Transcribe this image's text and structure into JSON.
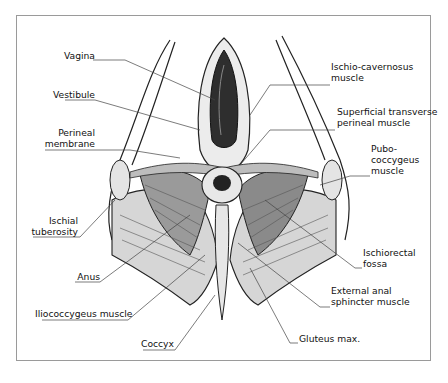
{
  "figure": {
    "frame": {
      "x": 16,
      "y": 15,
      "width": 414,
      "height": 345,
      "border_color": "#9a9a9a"
    },
    "colors": {
      "line": "#222222",
      "muscle_fill": "#d4d4d4",
      "dark_fill": "#3a3a3a",
      "leader": "#444444"
    },
    "labels": [
      {
        "id": "vagina",
        "lines": [
          "Vagina"
        ],
        "align": "right",
        "x": 92,
        "y": 45
      },
      {
        "id": "vestibule",
        "lines": [
          "Vestibule"
        ],
        "align": "right",
        "x": 92,
        "y": 86
      },
      {
        "id": "perineal-membrane",
        "lines": [
          "Perineal",
          "membrane"
        ],
        "align": "right",
        "x": 92,
        "y": 127
      },
      {
        "id": "ischial-tuberosity",
        "lines": [
          "Ischial",
          "tuberosity"
        ],
        "align": "right",
        "x": 76,
        "y": 215
      },
      {
        "id": "anus",
        "lines": [
          "Anus"
        ],
        "align": "right",
        "x": 99,
        "y": 270
      },
      {
        "id": "iliococcygeus-muscle",
        "lines": [
          "Iliococcygeus muscle"
        ],
        "align": "right",
        "x": 127,
        "y": 305
      },
      {
        "id": "coccyx",
        "lines": [
          "Coccyx"
        ],
        "align": "right",
        "x": 173,
        "y": 337
      },
      {
        "id": "ischio-cavernosus-muscle",
        "lines": [
          "Ischio-cavernosus",
          "muscle"
        ],
        "align": "left",
        "x": 331,
        "y": 60
      },
      {
        "id": "superficial-transverse-perineal-muscle",
        "lines": [
          "Superficial transverse",
          "perineal muscle"
        ],
        "align": "left",
        "x": 337,
        "y": 104
      },
      {
        "id": "pubo-coccygeus-muscle",
        "lines": [
          "Pubo-",
          "coccygeus",
          "muscle"
        ],
        "align": "left",
        "x": 371,
        "y": 142
      },
      {
        "id": "ischiorectal-fossa",
        "lines": [
          "Ischiorectal",
          "fossa"
        ],
        "align": "left",
        "x": 363,
        "y": 247
      },
      {
        "id": "external-anal-sphincter-muscle",
        "lines": [
          "External anal",
          "sphincter muscle"
        ],
        "align": "left",
        "x": 331,
        "y": 285
      },
      {
        "id": "gluteus-max",
        "lines": [
          "Gluteus max."
        ],
        "align": "left",
        "x": 299,
        "y": 331
      }
    ]
  }
}
